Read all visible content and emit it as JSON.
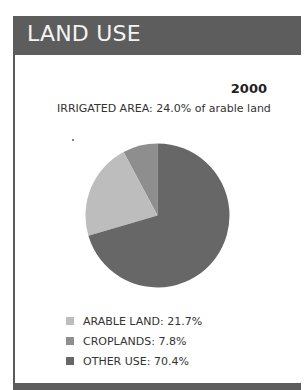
{
  "header": {
    "title": "Land Use"
  },
  "year": "2000",
  "irrigated_text": "IRRIGATED AREA: 24.0% of arable land",
  "legend": [
    {
      "label": "ARABLE LAND: 21.7%",
      "color": "#bdbdbd"
    },
    {
      "label": "CROPLANDS: 7.8%",
      "color": "#8e8e8e"
    },
    {
      "label": "OTHER USE: 70.4%",
      "color": "#676767"
    }
  ],
  "chart_data": {
    "type": "pie",
    "title": "LAND USE",
    "subtitle": "2000",
    "annotation": "IRRIGATED AREA: 24.0% of arable land",
    "categories": [
      "ARABLE LAND",
      "CROPLANDS",
      "OTHER USE"
    ],
    "values": [
      21.7,
      7.8,
      70.4
    ],
    "unit": "%",
    "colors": [
      "#bdbdbd",
      "#8e8e8e",
      "#676767"
    ],
    "legend_position": "bottom"
  }
}
